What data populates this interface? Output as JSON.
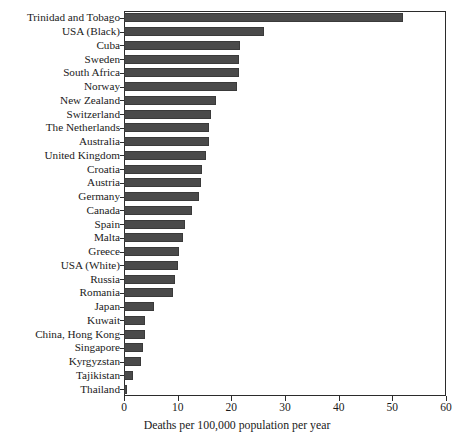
{
  "chart_data": {
    "type": "bar",
    "orientation": "horizontal",
    "title": "",
    "subtitle": "",
    "xlabel": "Deaths per 100,000 population per year",
    "ylabel": "",
    "xlim": [
      0,
      60
    ],
    "ylim": null,
    "grid": false,
    "legend": null,
    "xticks": [
      0,
      10,
      20,
      30,
      40,
      50,
      60
    ],
    "xticklabels": [
      "0",
      "10",
      "20",
      "30",
      "40",
      "50",
      "60"
    ],
    "bar_color": "#4a4a4a",
    "frame_color": "#2b2b2b",
    "background": "#ffffff",
    "categories": [
      "Trinidad and Tobago",
      "USA (Black)",
      "Cuba",
      "Sweden",
      "South Africa",
      "Norway",
      "New Zealand",
      "Switzerland",
      "The Netherlands",
      "Australia",
      "United Kingdom",
      "Croatia",
      "Austria",
      "Germany",
      "Canada",
      "Spain",
      "Malta",
      "Greece",
      "USA (White)",
      "Russia",
      "Romania",
      "Japan",
      "Kuwait",
      "China, Hong Kong",
      "Singapore",
      "Kyrgyzstan",
      "Tajikistan",
      "Thailand"
    ],
    "values": [
      52.0,
      26.0,
      21.6,
      21.5,
      21.4,
      21.0,
      17.1,
      16.2,
      15.9,
      15.8,
      15.3,
      14.6,
      14.3,
      13.9,
      12.7,
      11.4,
      11.0,
      10.3,
      10.0,
      9.5,
      9.2,
      5.5,
      4.0,
      4.0,
      3.5,
      3.2,
      1.7,
      0.6
    ]
  }
}
